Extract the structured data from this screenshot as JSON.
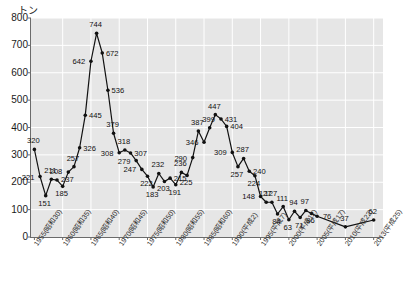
{
  "chart_data": {
    "type": "line",
    "title": "",
    "subtitle": "",
    "xlabel": "",
    "ylabel": "トン",
    "ylim": [
      0,
      800
    ],
    "ytick_step": 100,
    "yticks": [
      "0",
      "100",
      "200",
      "300",
      "400",
      "500",
      "600",
      "700",
      "800"
    ],
    "grid": true,
    "legend": "none",
    "xtick_labels": [
      "1955(昭和30)",
      "1960(昭和35)",
      "1965(昭和40)",
      "1970(昭和45)",
      "1975(昭和50)",
      "1980(昭和55)",
      "1985(昭和60)",
      "1990(平成2)",
      "1995(平成7)",
      "2000(平成12)",
      "2005(平成17)",
      "2010(平成22)",
      "2013(平成25)"
    ],
    "xtick_years": [
      1955,
      1960,
      1965,
      1970,
      1975,
      1980,
      1985,
      1990,
      1995,
      2000,
      2005,
      2010,
      2013
    ],
    "x": [
      1955,
      1956,
      1957,
      1958,
      1959,
      1960,
      1961,
      1962,
      1963,
      1964,
      1965,
      1966,
      1967,
      1968,
      1969,
      1970,
      1971,
      1972,
      1973,
      1974,
      1975,
      1976,
      1977,
      1978,
      1979,
      1980,
      1981,
      1982,
      1983,
      1984,
      1985,
      1986,
      1987,
      1988,
      1989,
      1990,
      1991,
      1992,
      1993,
      1994,
      1995,
      1996,
      1997,
      1998,
      1999,
      2000,
      2001,
      2002,
      2003,
      2004,
      2005,
      2010,
      2013
    ],
    "values": [
      320,
      221,
      151,
      211,
      208,
      185,
      237,
      257,
      326,
      445,
      642,
      744,
      672,
      536,
      379,
      308,
      318,
      307,
      279,
      247,
      222,
      183,
      232,
      203,
      215,
      191,
      236,
      225,
      290,
      387,
      346,
      399,
      447,
      431,
      404,
      309,
      257,
      287,
      240,
      224,
      148,
      127,
      127,
      84,
      111,
      63,
      94,
      71,
      97,
      86,
      76,
      37,
      62
    ],
    "point_labels": [
      "320",
      "221",
      "151",
      "211",
      "208",
      "185",
      "237",
      "257",
      "326",
      "445",
      "642",
      "744",
      "672",
      "536",
      "379",
      "308",
      "318",
      "307",
      "279",
      "247",
      "222",
      "183",
      "232",
      "203",
      "215",
      "191",
      "236",
      "225",
      "290",
      "387",
      "346",
      "399",
      "447",
      "431",
      "404",
      "309",
      "257",
      "287",
      "240",
      "224",
      "148",
      "127",
      "127",
      "84",
      "111",
      "63",
      "94",
      "71",
      "97",
      "86",
      "76",
      "37",
      "62"
    ],
    "label_side": [
      "up",
      "left",
      "down",
      "up",
      "up",
      "down",
      "down",
      "up",
      "right",
      "right",
      "left",
      "up",
      "right",
      "right",
      "up",
      "left",
      "up",
      "right",
      "left",
      "left",
      "down",
      "down",
      "up",
      "down",
      "right",
      "down",
      "up",
      "down",
      "left",
      "up",
      "left",
      "up",
      "up",
      "right",
      "right",
      "left",
      "down",
      "up",
      "right",
      "down",
      "left",
      "up",
      "up",
      "down",
      "up",
      "down",
      "up",
      "down",
      "up",
      "down",
      "right",
      "up",
      "up"
    ],
    "series_color": "#111111",
    "plot_bg": "#e6e6e6",
    "grid_color": "#ffffff"
  },
  "caption": ""
}
